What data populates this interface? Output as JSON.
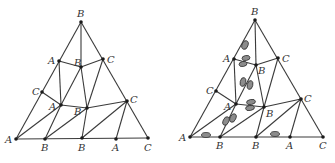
{
  "figure": {
    "colors": {
      "edge": "#3a3a3a",
      "vertex": "#1a1a1a",
      "label": "#333333",
      "blob_fill": "#8c8c8c"
    }
  },
  "left_triangle": {
    "vertices": [
      {
        "id": "v0",
        "label": "B",
        "x": 81,
        "y": 22,
        "lx": 77,
        "ly": 17
      },
      {
        "id": "v1",
        "label": "A",
        "x": 59,
        "y": 61,
        "lx": 48,
        "ly": 64
      },
      {
        "id": "v2",
        "label": "B",
        "x": 81,
        "y": 67,
        "lx": 74,
        "ly": 66
      },
      {
        "id": "v3",
        "label": "C",
        "x": 103,
        "y": 59,
        "lx": 107,
        "ly": 63
      },
      {
        "id": "v4",
        "label": "C",
        "x": 42,
        "y": 92,
        "lx": 32,
        "ly": 95
      },
      {
        "id": "v5",
        "label": "A",
        "x": 61,
        "y": 105,
        "lx": 49,
        "ly": 110
      },
      {
        "id": "v6",
        "label": "B",
        "x": 87,
        "y": 108,
        "lx": 74,
        "ly": 115
      },
      {
        "id": "v7",
        "label": "C",
        "x": 127,
        "y": 101,
        "lx": 130,
        "ly": 103
      },
      {
        "id": "v8",
        "label": "A",
        "x": 16,
        "y": 139,
        "lx": 5,
        "ly": 143
      },
      {
        "id": "v9",
        "label": "B",
        "x": 45,
        "y": 139,
        "lx": 41,
        "ly": 151
      },
      {
        "id": "v10",
        "label": "B",
        "x": 82,
        "y": 138,
        "lx": 78,
        "ly": 151
      },
      {
        "id": "v11",
        "label": "A",
        "x": 116,
        "y": 139,
        "lx": 112,
        "ly": 151
      },
      {
        "id": "v12",
        "label": "C",
        "x": 148,
        "y": 138,
        "lx": 144,
        "ly": 151
      }
    ]
  },
  "right_triangle": {
    "vertices": [
      {
        "id": "w0",
        "label": "B",
        "x": 255,
        "y": 20,
        "lx": 251,
        "ly": 15
      },
      {
        "id": "w1",
        "label": "A",
        "x": 234,
        "y": 59,
        "lx": 223,
        "ly": 62
      },
      {
        "id": "w2",
        "label": "B",
        "x": 256,
        "y": 65,
        "lx": 258,
        "ly": 74
      },
      {
        "id": "w3",
        "label": "C",
        "x": 278,
        "y": 58,
        "lx": 282,
        "ly": 62
      },
      {
        "id": "w4",
        "label": "C",
        "x": 216,
        "y": 91,
        "lx": 206,
        "ly": 94
      },
      {
        "id": "w5",
        "label": "A",
        "x": 236,
        "y": 104,
        "lx": 224,
        "ly": 110
      },
      {
        "id": "w6",
        "label": "B",
        "x": 264,
        "y": 107,
        "lx": 266,
        "ly": 117
      },
      {
        "id": "w7",
        "label": "C",
        "x": 301,
        "y": 99,
        "lx": 304,
        "ly": 102
      },
      {
        "id": "w8",
        "label": "A",
        "x": 190,
        "y": 137,
        "lx": 179,
        "ly": 141
      },
      {
        "id": "w9",
        "label": "B",
        "x": 220,
        "y": 137,
        "lx": 216,
        "ly": 149
      },
      {
        "id": "w10",
        "label": "B",
        "x": 256,
        "y": 137,
        "lx": 252,
        "ly": 149
      },
      {
        "id": "w11",
        "label": "A",
        "x": 290,
        "y": 137,
        "lx": 286,
        "ly": 149
      },
      {
        "id": "w12",
        "label": "C",
        "x": 323,
        "y": 137,
        "lx": 319,
        "ly": 149
      }
    ],
    "blobs": [
      {
        "cx": 245,
        "cy": 45,
        "rx": 3,
        "ry": 4.5,
        "rot": 20
      },
      {
        "cx": 246,
        "cy": 58,
        "rx": 4,
        "ry": 2.5,
        "rot": -10
      },
      {
        "cx": 243,
        "cy": 64,
        "rx": 4,
        "ry": 2.5,
        "rot": -10
      },
      {
        "cx": 243,
        "cy": 82,
        "rx": 2.8,
        "ry": 4.5,
        "rot": 15
      },
      {
        "cx": 250,
        "cy": 85,
        "rx": 2.8,
        "ry": 4.5,
        "rot": 15
      },
      {
        "cx": 251,
        "cy": 102,
        "rx": 4.5,
        "ry": 2.5,
        "rot": -10
      },
      {
        "cx": 250,
        "cy": 108,
        "rx": 4.5,
        "ry": 2.5,
        "rot": -10
      },
      {
        "cx": 226,
        "cy": 121,
        "rx": 2.8,
        "ry": 4.5,
        "rot": 25
      },
      {
        "cx": 233,
        "cy": 118,
        "rx": 2.8,
        "ry": 4.5,
        "rot": 25
      },
      {
        "cx": 206,
        "cy": 135,
        "rx": 4.5,
        "ry": 2.5,
        "rot": 0
      },
      {
        "cx": 275,
        "cy": 134,
        "rx": 4.5,
        "ry": 2.5,
        "rot": 0
      }
    ]
  },
  "edges": [
    [
      "0",
      "8"
    ],
    [
      "0",
      "12"
    ],
    [
      "8",
      "12"
    ],
    [
      "0",
      "2"
    ],
    [
      "1",
      "2"
    ],
    [
      "2",
      "3"
    ],
    [
      "1",
      "5"
    ],
    [
      "4",
      "5"
    ],
    [
      "2",
      "5"
    ],
    [
      "2",
      "6"
    ],
    [
      "3",
      "6"
    ],
    [
      "5",
      "6"
    ],
    [
      "6",
      "7"
    ],
    [
      "5",
      "8"
    ],
    [
      "5",
      "9"
    ],
    [
      "6",
      "9"
    ],
    [
      "6",
      "10"
    ],
    [
      "7",
      "10"
    ],
    [
      "7",
      "11"
    ]
  ]
}
